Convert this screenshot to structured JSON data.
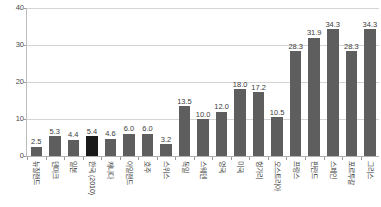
{
  "chart_data": {
    "type": "bar",
    "title": "",
    "xlabel": "",
    "ylabel": "",
    "ylim": [
      0,
      40
    ],
    "yticks": [
      0,
      10,
      20,
      30,
      40
    ],
    "ytick_labels": [
      "0",
      "10",
      "20",
      "30",
      "40"
    ],
    "grid": true,
    "legend": "none",
    "highlight_category": "한국 (2010)",
    "categories": [
      "뉴질랜드",
      "덴마크",
      "일본",
      "한국 (2010)",
      "캐나다",
      "아일랜드",
      "호주",
      "스위스",
      "독일",
      "스웨덴",
      "영국",
      "미국",
      "헝가리",
      "오스트리아",
      "프랑스",
      "핀란드",
      "스페인",
      "포르투갈",
      "그리스"
    ],
    "values": [
      2.5,
      5.3,
      4.4,
      5.4,
      4.6,
      6.0,
      6.0,
      3.2,
      13.5,
      10.0,
      12.0,
      18.0,
      17.2,
      10.5,
      28.3,
      31.9,
      34.3,
      28.3,
      34.3
    ],
    "value_labels": [
      "2.5",
      "5.3",
      "4.4",
      "5.4",
      "4.6",
      "6.0",
      "6.0",
      "3.2",
      "13.5",
      "10.0",
      "12.0",
      "18.0",
      "17.2",
      "10.5",
      "28.3",
      "31.9",
      "34.3",
      "28.3",
      "34.3"
    ],
    "bar_color": "#5e5e5e",
    "highlight_color": "#1a1a1a",
    "gridline_color": "#d4d4d4"
  },
  "title_strip": {
    "text": ""
  }
}
